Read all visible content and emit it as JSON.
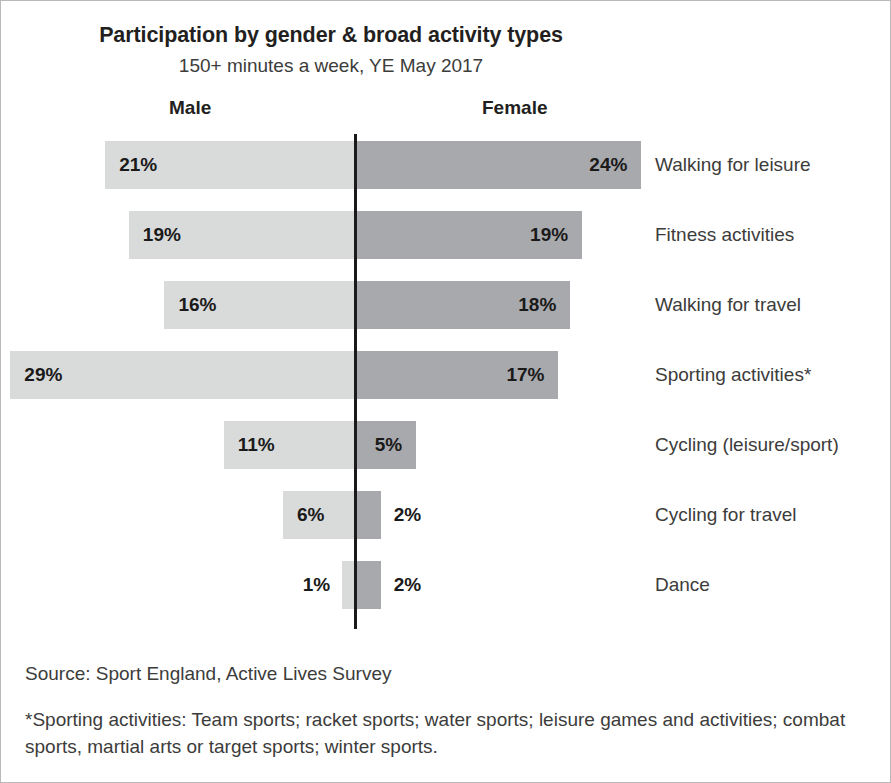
{
  "header": {
    "title": "Participation by gender & broad activity types",
    "subtitle": "150+ minutes a week, YE May 2017",
    "male_label": "Male",
    "female_label": "Female"
  },
  "footer": {
    "source": "Source: Sport England, Active Lives Survey",
    "footnote": "*Sporting activities: Team sports; racket sports; water sports; leisure games and activities; combat sports, martial arts or target sports; winter sports."
  },
  "colors": {
    "male_bar": "#d9dada",
    "female_bar": "#a8a9ad",
    "axis": "#1a1a1a",
    "text": "#3c3c3b",
    "title": "#231f20",
    "frame": "#b9b9b9"
  },
  "chart_data": {
    "type": "bar",
    "subtype": "diverging-tornado",
    "title": "Participation by gender & broad activity types",
    "subtitle": "150+ minutes a week, YE May 2017",
    "xlabel": "",
    "ylabel": "",
    "unit": "%",
    "grid": false,
    "legend_position": "top",
    "axis_center": true,
    "categories": [
      "Walking for leisure",
      "Fitness activities",
      "Walking for travel",
      "Sporting activities*",
      "Cycling (leisure/sport)",
      "Cycling for travel",
      "Dance"
    ],
    "series": [
      {
        "name": "Male",
        "direction": "left",
        "values": [
          21,
          19,
          16,
          29,
          11,
          6,
          1
        ],
        "labels": [
          "21%",
          "19%",
          "16%",
          "29%",
          "11%",
          "6%",
          "1%"
        ]
      },
      {
        "name": "Female",
        "direction": "right",
        "values": [
          24,
          19,
          18,
          17,
          5,
          2,
          2
        ],
        "labels": [
          "24%",
          "19%",
          "18%",
          "17%",
          "5%",
          "2%",
          "2%"
        ]
      }
    ],
    "xlim": [
      -30,
      25
    ]
  },
  "rows": [
    {
      "category": "Walking for leisure",
      "male_label": "21%",
      "female_label": "24%",
      "male_value": 21,
      "female_value": 24,
      "male_label_inside": true,
      "female_label_inside": true
    },
    {
      "category": "Fitness activities",
      "male_label": "19%",
      "female_label": "19%",
      "male_value": 19,
      "female_value": 19,
      "male_label_inside": true,
      "female_label_inside": true
    },
    {
      "category": "Walking for travel",
      "male_label": "16%",
      "female_label": "18%",
      "male_value": 16,
      "female_value": 18,
      "male_label_inside": true,
      "female_label_inside": true
    },
    {
      "category": "Sporting activities*",
      "male_label": "29%",
      "female_label": "17%",
      "male_value": 29,
      "female_value": 17,
      "male_label_inside": true,
      "female_label_inside": true
    },
    {
      "category": "Cycling (leisure/sport)",
      "male_label": "11%",
      "female_label": "5%",
      "male_value": 11,
      "female_value": 5,
      "male_label_inside": true,
      "female_label_inside": true
    },
    {
      "category": "Cycling for travel",
      "male_label": "6%",
      "female_label": "2%",
      "male_value": 6,
      "female_value": 2,
      "male_label_inside": true,
      "female_label_inside": false
    },
    {
      "category": "Dance",
      "male_label": "1%",
      "female_label": "2%",
      "male_value": 1,
      "female_value": 2,
      "male_label_inside": false,
      "female_label_inside": false
    }
  ],
  "layout": {
    "axis_x": 353,
    "px_per_percent": 11.85,
    "row_pitch": 70,
    "row_height": 48,
    "first_row_top": 7
  }
}
